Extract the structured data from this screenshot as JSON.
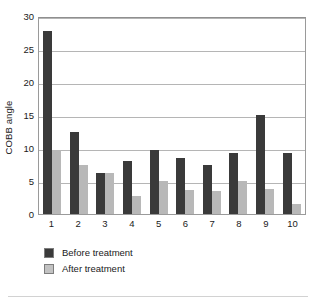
{
  "chart_data": {
    "type": "bar",
    "title": "",
    "xlabel": "",
    "ylabel": "COBB angle",
    "categories": [
      "1",
      "2",
      "3",
      "4",
      "5",
      "6",
      "7",
      "8",
      "9",
      "10"
    ],
    "series": [
      {
        "name": "Before treatment",
        "color": "#3a3a3a",
        "values": [
          27.8,
          12.5,
          6.2,
          8.0,
          9.7,
          8.5,
          7.5,
          9.3,
          15.0,
          9.3
        ]
      },
      {
        "name": "After treatment",
        "color": "#b8b8b8",
        "values": [
          9.7,
          7.4,
          6.2,
          2.8,
          5.0,
          3.7,
          3.5,
          5.0,
          3.8,
          1.5
        ]
      }
    ],
    "ylim": [
      0,
      30
    ],
    "yticks": [
      0,
      5,
      10,
      15,
      20,
      25,
      30
    ],
    "ytick_labels": [
      "0",
      "5",
      "10",
      "15",
      "20",
      "25",
      "30"
    ],
    "grid": true,
    "legend_position": "bottom-left"
  }
}
